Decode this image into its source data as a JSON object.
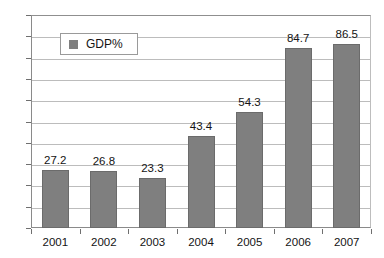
{
  "chart_data": {
    "type": "bar",
    "title": "",
    "xlabel": "",
    "ylabel": "",
    "categories": [
      "2001",
      "2002",
      "2003",
      "2004",
      "2005",
      "2006",
      "2007"
    ],
    "values": [
      27.2,
      26.8,
      23.3,
      43.4,
      54.3,
      84.7,
      86.5
    ],
    "value_labels": [
      "27.2",
      "26.8",
      "23.3",
      "43.4",
      "54.3",
      "84.7",
      "86.5"
    ],
    "series": [
      {
        "name": "GDP%",
        "values": [
          27.2,
          26.8,
          23.3,
          43.4,
          54.3,
          84.7,
          86.5
        ],
        "color": "#7f7f7f"
      }
    ],
    "ylim": [
      0,
      100
    ],
    "ytick_step": 10,
    "ytick_labels": [
      "0",
      "10",
      "20",
      "30",
      "40",
      "50",
      "60",
      "70",
      "80",
      "90",
      "100"
    ],
    "grid": true,
    "grid_axis": "y",
    "legend": {
      "position": "upper-left-inside",
      "entries": [
        {
          "label": "GDP%",
          "marker": "square",
          "color": "#7f7f7f"
        }
      ]
    },
    "colors": {
      "bar_fill": "#7f7f7f",
      "bar_border": "#6b6b6b",
      "gridline": "#bcbcbc",
      "axis": "#8a8a8a",
      "text": "#141414",
      "background": "#ffffff"
    }
  }
}
